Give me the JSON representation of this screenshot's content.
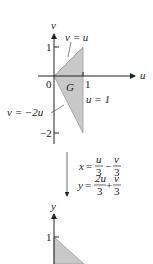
{
  "top_plot": {
    "x_axis_label": "u",
    "y_axis_label": "v",
    "tick_y_1": "1",
    "tick_y_neg2": "−2",
    "tick_x_1": "1",
    "origin": "0",
    "region_label": "G",
    "line_upper": "v = u",
    "line_lower": "v = −2u",
    "line_right": "u = 1",
    "region_color": "#c8c8c8"
  },
  "transform": {
    "eq1_lhs": "x",
    "eq1_t1_num": "u",
    "eq1_t1_den": "3",
    "eq1_op": "−",
    "eq1_t2_num": "v",
    "eq1_t2_den": "3",
    "eq2_lhs": "y",
    "eq2_t1_num": "2u",
    "eq2_t1_den": "3",
    "eq2_op": "+",
    "eq2_t2_num": "v",
    "eq2_t2_den": "3",
    "equals": "="
  },
  "bottom_plot": {
    "y_axis_label": "y",
    "tick_y_1": "1",
    "region_color": "#c8c8c8"
  }
}
